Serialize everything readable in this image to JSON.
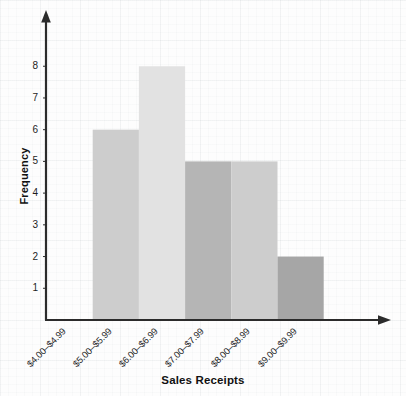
{
  "chart_data": {
    "type": "bar",
    "title": "",
    "subtitle": "",
    "xlabel": "Sales Receipts",
    "ylabel": "Frequency",
    "categories": [
      "$4.00–$4.99",
      "$5.00–$5.99",
      "$6.00–$6.99",
      "$7.00–$7.99",
      "$8.00–$8.99",
      "$9.00–$9.99"
    ],
    "values": [
      0,
      6,
      8,
      5,
      5,
      2
    ],
    "bar_colors": [
      "#ffffff",
      "#cdcdcd",
      "#e2e2e2",
      "#b5b5b5",
      "#cdcdcd",
      "#a6a6a6"
    ],
    "ylim": [
      0,
      9
    ],
    "yticks": [
      1,
      2,
      3,
      4,
      5,
      6,
      7,
      8
    ],
    "ytick_labels": [
      "1",
      "2",
      "3",
      "4",
      "5",
      "6",
      "7",
      "8"
    ],
    "grid": true,
    "legend": null,
    "axis_color": "#2b2b2b",
    "x_axis_arrow": true,
    "y_axis_arrow": true,
    "annotations": []
  }
}
